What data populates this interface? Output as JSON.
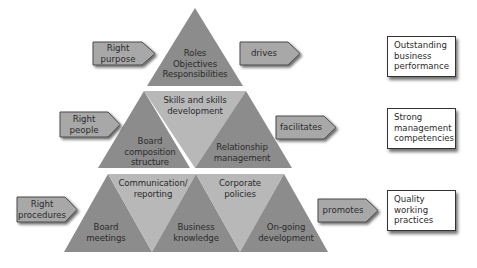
{
  "colors": {
    "dark_segment": "#8c8c8c",
    "light_segment": "#b8b8b8",
    "arrow_fill": "#a8a8a8",
    "arrow_stroke": "#4a4a4a",
    "box_border": "#333333",
    "text": "#2b2b2b",
    "background": "#ffffff"
  },
  "pyramid": {
    "tier1": {
      "segments": [
        {
          "label": "Roles\nObjectives\nResponsibilities",
          "shade": "dark"
        }
      ]
    },
    "tier2": {
      "segments": [
        {
          "label": "Skills and skills\ndevelopment",
          "shade": "light"
        },
        {
          "label": "Board\ncomposition\nstructure",
          "shade": "dark"
        },
        {
          "label": "Relationship\nmanagement",
          "shade": "dark"
        }
      ]
    },
    "tier3": {
      "segments": [
        {
          "label": "Communication/\nreporting",
          "shade": "light"
        },
        {
          "label": "Corporate\npolicies",
          "shade": "light"
        },
        {
          "label": "Board\nmeetings",
          "shade": "dark"
        },
        {
          "label": "Business\nknowledge",
          "shade": "dark"
        },
        {
          "label": "On-going\ndevelopment",
          "shade": "dark"
        }
      ]
    }
  },
  "left_arrows": [
    {
      "label": "Right\npurpose"
    },
    {
      "label": "Right\npeople"
    },
    {
      "label": "Right\nprocedures"
    }
  ],
  "right_arrows": [
    {
      "label": "drives"
    },
    {
      "label": "facilitates"
    },
    {
      "label": "promotes"
    }
  ],
  "outcomes": [
    {
      "label": "Outstanding\nbusiness\nperformance"
    },
    {
      "label": "Strong\nmanagement\ncompetencies"
    },
    {
      "label": "Quality\nworking\npractices"
    }
  ]
}
